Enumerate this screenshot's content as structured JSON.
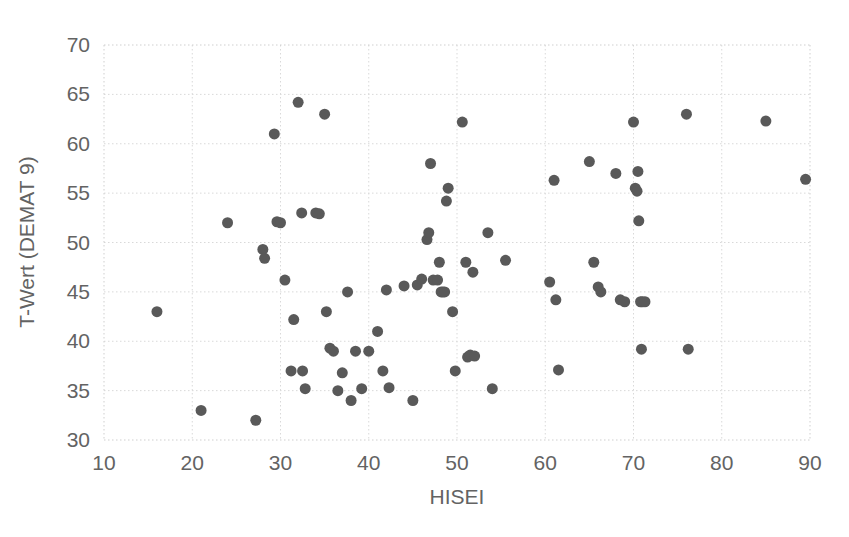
{
  "chart_data": {
    "type": "scatter",
    "title": "",
    "xlabel": "HISEI",
    "ylabel": "T-Wert (DEMAT 9)",
    "xlim": [
      10,
      90
    ],
    "ylim": [
      30,
      70
    ],
    "xticks": [
      10,
      20,
      30,
      40,
      50,
      60,
      70,
      80,
      90
    ],
    "yticks": [
      30,
      35,
      40,
      45,
      50,
      55,
      60,
      65,
      70
    ],
    "xtick_labels": [
      "10",
      "20",
      "30",
      "40",
      "50",
      "60",
      "70",
      "80",
      "90"
    ],
    "ytick_labels": [
      "30",
      "35",
      "40",
      "45",
      "50",
      "55",
      "60",
      "65",
      "70"
    ],
    "grid": true,
    "legend": "none",
    "marker": "circle",
    "marker_color": "#595959",
    "marker_size": 11,
    "series": [
      {
        "name": "Schueler",
        "points": [
          [
            16.0,
            43.0
          ],
          [
            21.0,
            33.0
          ],
          [
            24.0,
            52.0
          ],
          [
            27.2,
            32.0
          ],
          [
            28.0,
            49.3
          ],
          [
            28.2,
            48.4
          ],
          [
            29.3,
            61.0
          ],
          [
            29.6,
            52.1
          ],
          [
            30.0,
            52.0
          ],
          [
            30.5,
            46.2
          ],
          [
            31.2,
            37.0
          ],
          [
            31.5,
            42.2
          ],
          [
            32.0,
            64.2
          ],
          [
            32.4,
            53.0
          ],
          [
            32.5,
            37.0
          ],
          [
            32.8,
            35.2
          ],
          [
            34.0,
            53.0
          ],
          [
            34.4,
            52.9
          ],
          [
            35.0,
            63.0
          ],
          [
            35.2,
            43.0
          ],
          [
            35.6,
            39.3
          ],
          [
            36.0,
            39.0
          ],
          [
            36.5,
            35.0
          ],
          [
            37.0,
            36.8
          ],
          [
            37.6,
            45.0
          ],
          [
            38.0,
            34.0
          ],
          [
            38.5,
            39.0
          ],
          [
            39.2,
            35.2
          ],
          [
            40.0,
            39.0
          ],
          [
            41.0,
            41.0
          ],
          [
            41.6,
            37.0
          ],
          [
            42.0,
            45.2
          ],
          [
            42.3,
            35.3
          ],
          [
            44.0,
            45.6
          ],
          [
            45.0,
            34.0
          ],
          [
            45.5,
            45.7
          ],
          [
            46.0,
            46.3
          ],
          [
            46.6,
            50.3
          ],
          [
            46.8,
            51.0
          ],
          [
            47.0,
            58.0
          ],
          [
            47.3,
            46.2
          ],
          [
            47.8,
            46.2
          ],
          [
            48.0,
            48.0
          ],
          [
            48.2,
            45.0
          ],
          [
            48.4,
            45.0
          ],
          [
            48.6,
            45.0
          ],
          [
            48.8,
            54.2
          ],
          [
            49.0,
            55.5
          ],
          [
            49.5,
            43.0
          ],
          [
            49.8,
            37.0
          ],
          [
            50.6,
            62.2
          ],
          [
            51.0,
            48.0
          ],
          [
            51.2,
            38.4
          ],
          [
            51.5,
            38.6
          ],
          [
            51.8,
            47.0
          ],
          [
            52.0,
            38.5
          ],
          [
            53.5,
            51.0
          ],
          [
            54.0,
            35.2
          ],
          [
            55.5,
            48.2
          ],
          [
            60.5,
            46.0
          ],
          [
            61.0,
            56.3
          ],
          [
            61.2,
            44.2
          ],
          [
            61.5,
            37.1
          ],
          [
            65.0,
            58.2
          ],
          [
            65.5,
            48.0
          ],
          [
            66.0,
            45.5
          ],
          [
            66.3,
            45.0
          ],
          [
            68.0,
            57.0
          ],
          [
            68.5,
            44.2
          ],
          [
            69.0,
            44.0
          ],
          [
            70.0,
            62.2
          ],
          [
            70.2,
            55.5
          ],
          [
            70.4,
            55.2
          ],
          [
            70.5,
            57.2
          ],
          [
            70.6,
            52.2
          ],
          [
            70.8,
            44.0
          ],
          [
            70.9,
            39.2
          ],
          [
            71.0,
            44.0
          ],
          [
            71.3,
            44.0
          ],
          [
            76.0,
            63.0
          ],
          [
            76.2,
            39.2
          ],
          [
            85.0,
            62.3
          ],
          [
            89.5,
            56.4
          ]
        ]
      }
    ]
  },
  "geometry": {
    "plot_left": 104,
    "plot_right": 810,
    "plot_top": 45,
    "plot_bottom": 440
  }
}
